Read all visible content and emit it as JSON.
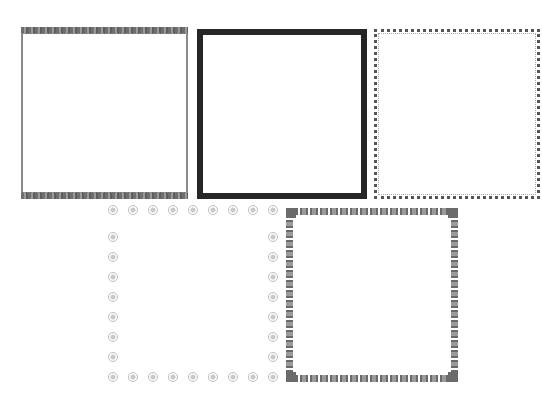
{
  "frames": [
    {
      "id": "f1",
      "style": "wavy-top-bottom",
      "color": "#6f6f6f"
    },
    {
      "id": "f2",
      "style": "thick-solid",
      "color": "#262626"
    },
    {
      "id": "f3",
      "style": "dotted-stars",
      "color": "#555555"
    },
    {
      "id": "f4",
      "style": "faint-ornament-dots",
      "color": "#bdbdbd"
    },
    {
      "id": "f5",
      "style": "chain-hearts",
      "color": "#6a6a6a"
    }
  ]
}
